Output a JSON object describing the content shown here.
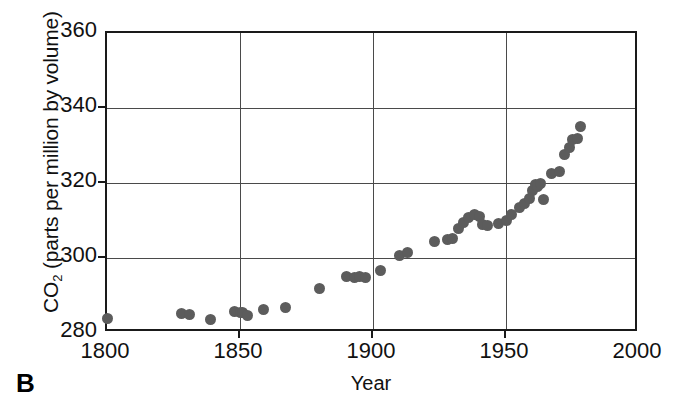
{
  "figure": {
    "panel_label": "B"
  },
  "chart_data": {
    "type": "scatter",
    "title": "",
    "subtitle": "",
    "xlabel": "Year",
    "ylabel": "CO2 (parts per million by volume)",
    "ylabel_base": "CO",
    "ylabel_sub": "2",
    "ylabel_rest": " (parts per million by volume)",
    "xlim": [
      1800,
      2000
    ],
    "ylim": [
      280,
      360
    ],
    "xticks": [
      1800,
      1850,
      1900,
      1950,
      2000
    ],
    "xtick_labels": [
      "1800",
      "1850",
      "1900",
      "1950",
      "2000"
    ],
    "yticks": [
      280,
      300,
      320,
      340,
      360
    ],
    "ytick_labels": [
      "280",
      "300",
      "320",
      "340",
      "360"
    ],
    "grid": "both",
    "legend": "none",
    "marker_color": "#5c5c5c",
    "axis_color": "#1a1a1a",
    "grid_color": "#4a4a4a",
    "background_color": "#ffffff",
    "series": [
      {
        "name": "Atmospheric CO2",
        "points": [
          [
            1800,
            284.0
          ],
          [
            1828,
            285.2
          ],
          [
            1831,
            285.0
          ],
          [
            1839,
            283.7
          ],
          [
            1848,
            285.8
          ],
          [
            1850,
            285.6
          ],
          [
            1851,
            285.4
          ],
          [
            1853,
            284.8
          ],
          [
            1859,
            286.3
          ],
          [
            1867,
            286.7
          ],
          [
            1880,
            291.9
          ],
          [
            1890,
            295.0
          ],
          [
            1893,
            294.9
          ],
          [
            1895,
            295.0
          ],
          [
            1897,
            294.8
          ],
          [
            1903,
            296.8
          ],
          [
            1910,
            300.7
          ],
          [
            1913,
            301.4
          ],
          [
            1923,
            304.5
          ],
          [
            1928,
            305.0
          ],
          [
            1930,
            305.3
          ],
          [
            1932,
            307.8
          ],
          [
            1934,
            309.5
          ],
          [
            1936,
            310.7
          ],
          [
            1938,
            311.5
          ],
          [
            1940,
            311.0
          ],
          [
            1941,
            309.0
          ],
          [
            1943,
            308.8
          ],
          [
            1947,
            309.3
          ],
          [
            1950,
            310.0
          ],
          [
            1952,
            311.5
          ],
          [
            1955,
            313.5
          ],
          [
            1957,
            314.5
          ],
          [
            1959,
            315.8
          ],
          [
            1960,
            318.0
          ],
          [
            1961,
            319.5
          ],
          [
            1962,
            319.0
          ],
          [
            1963,
            319.8
          ],
          [
            1964,
            315.5
          ],
          [
            1967,
            322.5
          ],
          [
            1970,
            323.0
          ],
          [
            1972,
            327.5
          ],
          [
            1974,
            329.5
          ],
          [
            1975,
            331.5
          ],
          [
            1977,
            332.0
          ],
          [
            1978,
            335.0
          ]
        ]
      }
    ]
  }
}
